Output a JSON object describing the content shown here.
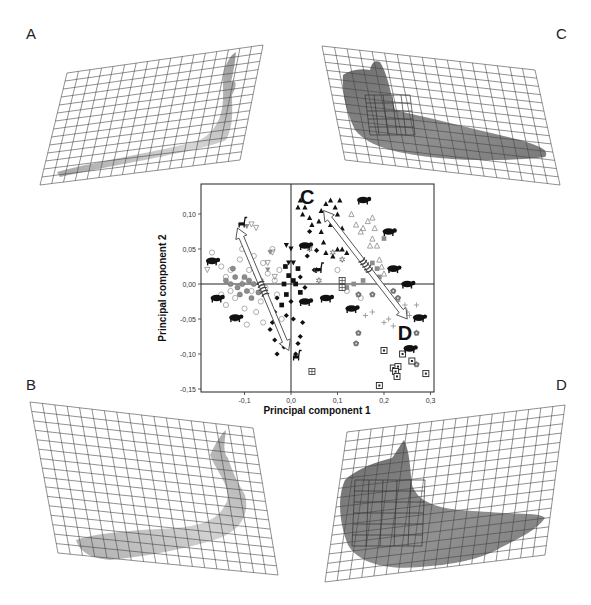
{
  "figure": {
    "panel_labels": {
      "A": "A",
      "B": "B",
      "C": "C",
      "D": "D"
    },
    "panels": [
      {
        "id": "A",
        "shade": "#bdbdbd",
        "desc": "light grey warped-grid mandible shape, thin elongated"
      },
      {
        "id": "B",
        "shade": "#c4c4c4",
        "desc": "light grey warped-grid mandible shape, curved"
      },
      {
        "id": "C",
        "shade": "#8a8a8a",
        "desc": "dark grey warped-grid mandible shape, with inner grid"
      },
      {
        "id": "D",
        "shade": "#8c8c8c",
        "desc": "dark grey warped-grid mandible shape, broad, with inner grid"
      }
    ]
  },
  "chart_data": {
    "type": "scatter",
    "title": "",
    "xlabel": "Principal component 1",
    "ylabel": "Principal component 2",
    "xlim": [
      -0.2,
      0.31
    ],
    "ylim": [
      -0.155,
      0.14
    ],
    "xticks": [
      -0.1,
      0.0,
      0.1,
      0.2,
      0.3
    ],
    "xtick_labels": [
      "-0,1",
      "0,0",
      "0,1",
      "0,2",
      "0,3"
    ],
    "yticks": [
      0.1,
      0.05,
      0.0,
      -0.05,
      -0.1,
      -0.15
    ],
    "ytick_labels": [
      "0,10",
      "0,05",
      "0,00",
      "-0,05",
      "-0,10",
      "-0,15"
    ],
    "grid": false,
    "reference_lines": {
      "x": 0.0,
      "y": 0.0
    },
    "annotations": [
      {
        "text": "C",
        "x": 0.035,
        "y": 0.125
      },
      {
        "text": "D",
        "x": 0.245,
        "y": -0.07
      }
    ],
    "arrows": [
      {
        "name": "left-arrow",
        "from": [
          -0.005,
          -0.095
        ],
        "to": [
          -0.115,
          0.08
        ],
        "style": "double-headed hollow with spring"
      },
      {
        "name": "right-arrow",
        "from": [
          0.07,
          0.105
        ],
        "to": [
          0.25,
          -0.05
        ],
        "style": "double-headed hollow with spring"
      }
    ],
    "series": [
      {
        "name": "grey open circles",
        "marker": "circle-open",
        "color": "#9a9a9a",
        "points": [
          [
            -0.17,
            0.045
          ],
          [
            -0.15,
            0.025
          ],
          [
            -0.14,
            0.01
          ],
          [
            -0.13,
            -0.01
          ],
          [
            -0.12,
            -0.02
          ],
          [
            -0.11,
            0.035
          ],
          [
            -0.1,
            0.005
          ],
          [
            -0.1,
            -0.035
          ],
          [
            -0.09,
            0.02
          ],
          [
            -0.085,
            -0.01
          ],
          [
            -0.08,
            0.04
          ],
          [
            -0.075,
            -0.04
          ],
          [
            -0.07,
            0.01
          ],
          [
            -0.065,
            -0.025
          ],
          [
            -0.06,
            0.03
          ],
          [
            -0.055,
            -0.005
          ],
          [
            -0.05,
            0.015
          ],
          [
            -0.045,
            -0.03
          ],
          [
            -0.04,
            0.05
          ],
          [
            -0.035,
            0.005
          ],
          [
            -0.03,
            -0.015
          ],
          [
            -0.025,
            0.02
          ],
          [
            -0.02,
            -0.05
          ],
          [
            -0.12,
            -0.05
          ],
          [
            -0.14,
            -0.03
          ],
          [
            -0.095,
            -0.058
          ],
          [
            -0.13,
            0.02
          ],
          [
            -0.15,
            -0.015
          ],
          [
            -0.105,
            0.05
          ],
          [
            -0.06,
            -0.055
          ],
          [
            0.1,
            0.02
          ],
          [
            0.12,
            -0.01
          ],
          [
            0.15,
            -0.02
          ]
        ]
      },
      {
        "name": "grey filled circles",
        "marker": "circle-filled",
        "color": "#8c8c8c",
        "points": [
          [
            -0.13,
            0.0
          ],
          [
            -0.12,
            0.01
          ],
          [
            -0.115,
            -0.005
          ],
          [
            -0.11,
            -0.015
          ],
          [
            -0.105,
            0.0
          ],
          [
            -0.1,
            0.01
          ],
          [
            -0.095,
            -0.01
          ],
          [
            -0.09,
            0.005
          ],
          [
            -0.085,
            -0.02
          ],
          [
            -0.08,
            0.0
          ],
          [
            -0.075,
            0.015
          ],
          [
            -0.07,
            -0.012
          ],
          [
            -0.125,
            0.022
          ],
          [
            -0.14,
            0.005
          ],
          [
            -0.065,
            0.005
          ]
        ]
      },
      {
        "name": "grey open triangles down",
        "marker": "tri-down-open",
        "color": "#8c8c8c",
        "points": [
          [
            -0.085,
            0.085
          ],
          [
            -0.075,
            0.08
          ],
          [
            -0.04,
            0.045
          ],
          [
            -0.035,
            0.01
          ],
          [
            -0.18,
            0.02
          ],
          [
            -0.05,
            0.03
          ]
        ]
      },
      {
        "name": "grey filled triangles down",
        "marker": "tri-down-filled",
        "color": "#8c8c8c",
        "points": [
          [
            -0.095,
            0.082
          ],
          [
            -0.045,
            0.045
          ],
          [
            -0.05,
            0.02
          ]
        ]
      },
      {
        "name": "black filled triangles down",
        "marker": "tri-down-filled",
        "color": "#111",
        "points": [
          [
            -0.01,
            0.055
          ],
          [
            0.0,
            0.05
          ],
          [
            -0.005,
            0.03
          ],
          [
            0.005,
            0.03
          ]
        ]
      },
      {
        "name": "black filled squares",
        "marker": "square-filled",
        "color": "#111",
        "points": [
          [
            -0.015,
            0.0
          ],
          [
            -0.01,
            -0.015
          ],
          [
            -0.02,
            -0.03
          ],
          [
            0.005,
            0.005
          ],
          [
            0.01,
            0.0
          ],
          [
            -0.005,
            0.012
          ],
          [
            0.02,
            -0.012
          ],
          [
            0.015,
            0.022
          ],
          [
            -0.012,
            0.025
          ]
        ]
      },
      {
        "name": "black filled diamonds",
        "marker": "diamond-filled",
        "color": "#111",
        "points": [
          [
            -0.03,
            -0.02
          ],
          [
            -0.035,
            -0.04
          ],
          [
            -0.04,
            -0.055
          ],
          [
            -0.045,
            -0.065
          ],
          [
            -0.035,
            -0.08
          ],
          [
            -0.01,
            -0.045
          ],
          [
            -0.015,
            -0.09
          ],
          [
            0.02,
            -0.075
          ],
          [
            0.015,
            -0.085
          ],
          [
            0.01,
            -0.1
          ],
          [
            0.025,
            -0.055
          ],
          [
            -0.03,
            -0.1
          ],
          [
            0.04,
            0.075
          ],
          [
            0.05,
            0.02
          ],
          [
            0.035,
            0.04
          ],
          [
            0.055,
            0.048
          ],
          [
            0.02,
            0.01
          ],
          [
            0.03,
            -0.005
          ],
          [
            0.0,
            -0.025
          ],
          [
            0.005,
            -0.05
          ]
        ]
      },
      {
        "name": "black filled triangles up",
        "marker": "tri-up-filled",
        "color": "#111",
        "points": [
          [
            0.02,
            0.12
          ],
          [
            0.015,
            0.11
          ],
          [
            0.03,
            0.11
          ],
          [
            0.025,
            0.1
          ],
          [
            0.04,
            0.095
          ],
          [
            0.045,
            0.085
          ],
          [
            0.06,
            0.09
          ],
          [
            0.065,
            0.105
          ],
          [
            0.075,
            0.115
          ],
          [
            0.085,
            0.12
          ],
          [
            0.095,
            0.11
          ],
          [
            0.1,
            0.1
          ],
          [
            0.105,
            0.12
          ],
          [
            0.11,
            0.08
          ],
          [
            0.085,
            0.085
          ],
          [
            0.07,
            0.06
          ],
          [
            0.09,
            0.04
          ],
          [
            0.1,
            0.05
          ],
          [
            0.11,
            0.05
          ],
          [
            0.12,
            0.045
          ],
          [
            0.075,
            0.045
          ],
          [
            0.065,
            0.075
          ]
        ]
      },
      {
        "name": "grey open triangles up",
        "marker": "tri-up-open",
        "color": "#8c8c8c",
        "points": [
          [
            0.13,
            0.1
          ],
          [
            0.14,
            0.085
          ],
          [
            0.155,
            0.08
          ],
          [
            0.165,
            0.09
          ],
          [
            0.175,
            0.095
          ],
          [
            0.18,
            0.08
          ],
          [
            0.17,
            0.055
          ],
          [
            0.185,
            0.055
          ],
          [
            0.19,
            0.035
          ],
          [
            0.2,
            0.015
          ],
          [
            0.195,
            0.025
          ],
          [
            0.15,
            0.075
          ],
          [
            0.175,
            0.065
          ]
        ]
      },
      {
        "name": "grey filled squares",
        "marker": "square-filled",
        "color": "#8c8c8c",
        "points": [
          [
            0.2,
            0.065
          ],
          [
            0.175,
            0.03
          ],
          [
            0.165,
            0.02
          ],
          [
            0.185,
            0.022
          ],
          [
            0.19,
            0.01
          ],
          [
            0.135,
            0.0
          ],
          [
            0.12,
            -0.005
          ],
          [
            0.155,
            0.005
          ]
        ]
      },
      {
        "name": "open stars",
        "marker": "star-open",
        "color": "#555",
        "points": [
          [
            0.04,
            0.05
          ],
          [
            0.055,
            0.02
          ],
          [
            0.09,
            0.045
          ],
          [
            0.11,
            0.035
          ],
          [
            0.06,
            0.005
          ]
        ]
      },
      {
        "name": "grey pentagons",
        "marker": "pentagon",
        "color": "#777",
        "points": [
          [
            0.145,
            -0.015
          ],
          [
            0.175,
            -0.015
          ],
          [
            0.145,
            -0.07
          ],
          [
            0.14,
            -0.085
          ],
          [
            0.27,
            -0.07
          ],
          [
            0.27,
            -0.115
          ],
          [
            0.22,
            -0.01
          ],
          [
            0.23,
            -0.02
          ]
        ]
      },
      {
        "name": "grey plus",
        "marker": "plus",
        "color": "#999",
        "points": [
          [
            0.23,
            -0.025
          ],
          [
            0.245,
            -0.03
          ],
          [
            0.25,
            -0.04
          ],
          [
            0.27,
            -0.03
          ],
          [
            0.255,
            -0.045
          ],
          [
            0.21,
            -0.05
          ],
          [
            0.2,
            -0.055
          ],
          [
            0.22,
            -0.06
          ],
          [
            0.175,
            -0.04
          ],
          [
            0.16,
            -0.045
          ]
        ]
      },
      {
        "name": "boxed squares",
        "marker": "boxed-square",
        "color": "#222",
        "points": [
          [
            0.2,
            -0.095
          ],
          [
            0.24,
            -0.1
          ],
          [
            0.26,
            -0.11
          ],
          [
            0.29,
            -0.128
          ],
          [
            0.22,
            -0.12
          ],
          [
            0.23,
            -0.118
          ],
          [
            0.225,
            -0.125
          ],
          [
            0.228,
            -0.132
          ],
          [
            0.19,
            -0.145
          ]
        ]
      },
      {
        "name": "crossed squares",
        "marker": "crossed-square",
        "color": "#444",
        "points": [
          [
            0.11,
            0.005
          ],
          [
            0.11,
            -0.005
          ],
          [
            0.045,
            -0.125
          ]
        ]
      }
    ],
    "silhouettes": [
      {
        "name": "giraffe-icon",
        "x": -0.105,
        "y": 0.085
      },
      {
        "name": "moose-icon",
        "x": -0.17,
        "y": 0.033
      },
      {
        "name": "deer-icon",
        "x": -0.16,
        "y": -0.02
      },
      {
        "name": "bison-icon",
        "x": -0.12,
        "y": -0.048
      },
      {
        "name": "camel-icon",
        "x": 0.03,
        "y": 0.055
      },
      {
        "name": "llama-icon",
        "x": 0.06,
        "y": 0.02
      },
      {
        "name": "pig-icon",
        "x": 0.03,
        "y": -0.025
      },
      {
        "name": "vicuna-icon",
        "x": 0.012,
        "y": -0.105
      },
      {
        "name": "hippo-icon",
        "x": 0.075,
        "y": -0.02
      },
      {
        "name": "tapir-icon",
        "x": 0.155,
        "y": 0.12
      },
      {
        "name": "rhino-icon",
        "x": 0.21,
        "y": 0.075
      },
      {
        "name": "boar-icon",
        "x": 0.22,
        "y": 0.022
      },
      {
        "name": "rhino2-icon",
        "x": 0.25,
        "y": 0.0
      },
      {
        "name": "dog-icon",
        "x": 0.13,
        "y": -0.035
      },
      {
        "name": "hyrax-icon",
        "x": 0.275,
        "y": -0.048
      },
      {
        "name": "cat-icon",
        "x": 0.255,
        "y": -0.092
      }
    ]
  }
}
